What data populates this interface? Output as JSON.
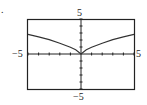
{
  "panel_label": ".",
  "labels": {
    "top": "5",
    "bottom": "−5",
    "left": "−5",
    "right": "5"
  },
  "chart_data": {
    "type": "line",
    "title": "",
    "xlabel": "",
    "ylabel": "",
    "xlim": [
      -5,
      5
    ],
    "ylim": [
      -5,
      5
    ],
    "grid": false,
    "tick_marks": "unit ticks on both axes",
    "series": [
      {
        "name": "curve",
        "x": [
          -5,
          -4,
          -3,
          -2,
          -1,
          -0.5,
          0,
          0.5,
          1,
          2,
          3,
          4,
          5
        ],
        "y": [
          2.8,
          2.45,
          2.05,
          1.55,
          0.95,
          0.6,
          0,
          0.6,
          0.95,
          1.55,
          2.05,
          2.45,
          2.8
        ]
      }
    ]
  }
}
